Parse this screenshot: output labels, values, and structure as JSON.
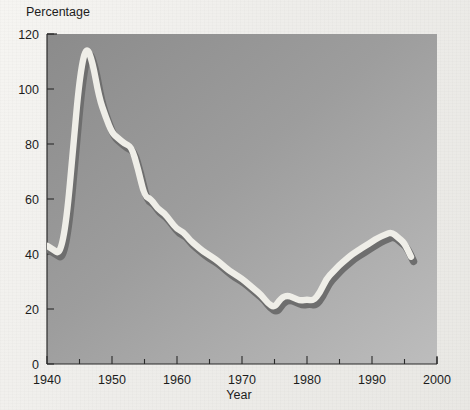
{
  "figure": {
    "y_axis_title": "Percentage",
    "x_axis_title": "Year",
    "plot_bg_top_left": "#8e8e8e",
    "plot_bg_bottom_right": "#b9b9b9",
    "page_bg": "#f2f1ee",
    "line_highlight_color": "#f0efe9",
    "line_shadow_color": "#6f6f6f",
    "axis_color": "#2b2b2b"
  },
  "chart_data": {
    "type": "line",
    "title": "",
    "subtitle": "",
    "xlabel": "Year",
    "ylabel": "Percentage",
    "xlim": [
      1940,
      2000
    ],
    "ylim": [
      0,
      120
    ],
    "grid": false,
    "legend": null,
    "y_ticks": [
      0,
      20,
      40,
      60,
      80,
      100,
      120
    ],
    "y_tick_labels": [
      "0",
      "20",
      "40",
      "60",
      "80",
      "100",
      "120"
    ],
    "x_ticks": [
      1940,
      1950,
      1960,
      1970,
      1980,
      1990,
      2000
    ],
    "x_tick_labels": [
      "1940",
      "1950",
      "1960",
      "1970",
      "1980",
      "1990",
      "2000"
    ],
    "x_minor_ticks": [
      1945,
      1955,
      1965,
      1975,
      1985,
      1995
    ],
    "series": [
      {
        "name": "Percentage",
        "x": [
          1940,
          1941,
          1942,
          1943,
          1944,
          1945,
          1946,
          1947,
          1948,
          1949,
          1950,
          1951,
          1952,
          1953,
          1954,
          1955,
          1956,
          1957,
          1958,
          1959,
          1960,
          1961,
          1962,
          1963,
          1964,
          1965,
          1966,
          1967,
          1968,
          1969,
          1970,
          1971,
          1972,
          1973,
          1974,
          1975,
          1976,
          1977,
          1978,
          1979,
          1980,
          1981,
          1982,
          1983,
          1984,
          1985,
          1986,
          1987,
          1988,
          1989,
          1990,
          1991,
          1992,
          1993,
          1994,
          1995,
          1996
        ],
        "values": [
          43,
          41.5,
          40,
          52,
          78,
          104,
          116,
          110,
          97,
          90,
          84,
          82,
          80,
          79,
          71,
          61,
          60,
          56.5,
          55,
          52,
          49,
          48,
          45,
          43,
          41,
          39.5,
          38,
          36,
          34,
          32.5,
          31,
          29,
          27,
          25,
          22,
          20.5,
          24,
          25,
          24,
          23,
          23.5,
          23,
          26,
          31,
          33.5,
          36,
          38,
          40,
          41.5,
          43,
          44.5,
          46,
          47,
          48,
          46,
          44,
          39
        ]
      }
    ]
  }
}
